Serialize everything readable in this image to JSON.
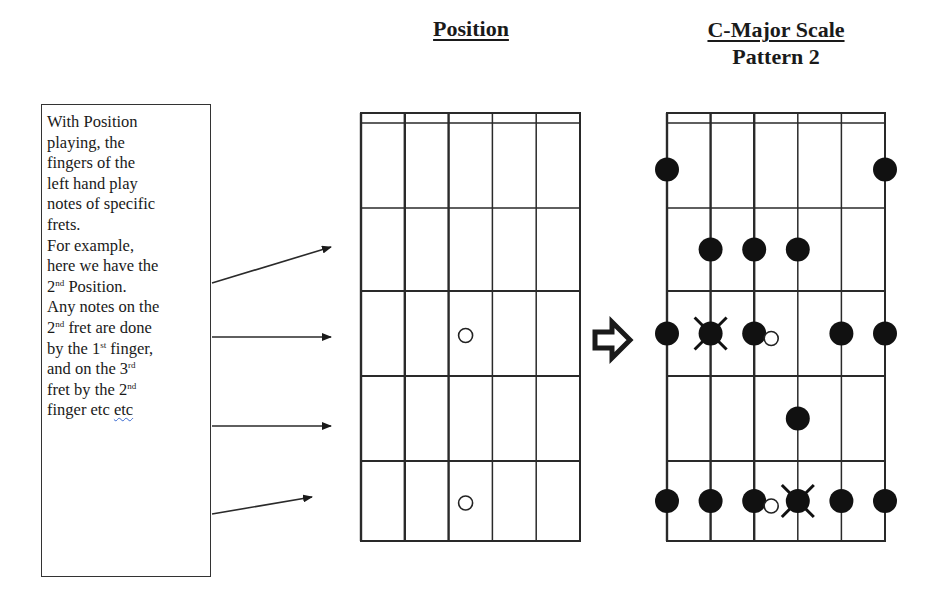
{
  "titles": {
    "position": "Position",
    "scale_line1": "C-Major Scale",
    "scale_line2": "Pattern 2"
  },
  "explanation": {
    "lines": [
      "With Position",
      "playing, the",
      "fingers of the",
      "left hand play",
      "notes of specific",
      "frets.",
      "For example,",
      "here we have the"
    ],
    "line_2nd_position": {
      "num": "2",
      "sup": "nd",
      "rest": " Position."
    },
    "line_any_notes": "Any notes on the",
    "line_2nd_fret": {
      "num": "2",
      "sup": "nd",
      "rest": " fret are done"
    },
    "line_1st_finger": {
      "pre": "by the 1",
      "sup": "st",
      "rest": " finger,"
    },
    "line_3rd": {
      "pre": "and on the 3",
      "sup": "rd"
    },
    "line_2nd_finger": {
      "pre": "fret by the 2",
      "sup": "nd"
    },
    "line_last": {
      "pre": "finger etc ",
      "squiggled": "etc"
    }
  },
  "transition_arrow_icon": "outlined-right-arrow",
  "diagrams": {
    "position": {
      "strings": 6,
      "frets": 5,
      "open_markers": [
        {
          "string": 3,
          "fret": 3
        },
        {
          "string": 3,
          "fret": 5
        }
      ]
    },
    "c_major_pattern_2": {
      "strings": 6,
      "frets": 5,
      "notes": [
        {
          "string": 1,
          "fret": 1
        },
        {
          "string": 6,
          "fret": 1
        },
        {
          "string": 2,
          "fret": 2
        },
        {
          "string": 3,
          "fret": 2
        },
        {
          "string": 4,
          "fret": 2
        },
        {
          "string": 1,
          "fret": 3
        },
        {
          "string": 2,
          "fret": 3,
          "root": true
        },
        {
          "string": 3,
          "fret": 3
        },
        {
          "string": 5,
          "fret": 3
        },
        {
          "string": 6,
          "fret": 3
        },
        {
          "string": 4,
          "fret": 4
        },
        {
          "string": 1,
          "fret": 5
        },
        {
          "string": 2,
          "fret": 5
        },
        {
          "string": 3,
          "fret": 5
        },
        {
          "string": 4,
          "fret": 5,
          "root": true
        },
        {
          "string": 5,
          "fret": 5
        },
        {
          "string": 6,
          "fret": 5
        }
      ],
      "open_markers": [
        {
          "string": 3,
          "fret": 3
        },
        {
          "string": 3,
          "fret": 5
        }
      ]
    }
  },
  "colors": {
    "ink": "#1a1a1a",
    "grid": "#2a2a2a",
    "background": "#ffffff"
  }
}
